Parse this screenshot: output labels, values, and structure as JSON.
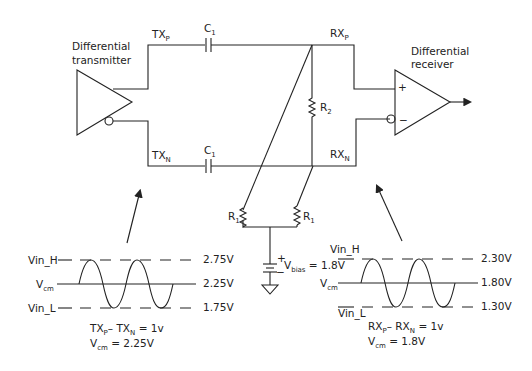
{
  "transmitter": {
    "label_line1": "Differential",
    "label_line2": "transmitter"
  },
  "receiver": {
    "label_line1": "Differential",
    "label_line2": "receiver",
    "plus": "+",
    "minus": "−"
  },
  "nets": {
    "txp": {
      "main": "TX",
      "sub": "P"
    },
    "txn": {
      "main": "TX",
      "sub": "N"
    },
    "rxp": {
      "main": "RX",
      "sub": "P"
    },
    "rxn": {
      "main": "RX",
      "sub": "N"
    }
  },
  "components": {
    "c1_top": {
      "main": "C",
      "sub": "1"
    },
    "c1_bot": {
      "main": "C",
      "sub": "1"
    },
    "r2": {
      "main": "R",
      "sub": "2"
    },
    "r1_left": {
      "main": "R",
      "sub": "1"
    },
    "r1_right": {
      "main": "R",
      "sub": "1"
    },
    "vbias": {
      "main": "V",
      "sub": "bias",
      "value": " = 1.8V",
      "plus": "+",
      "minus": "−"
    }
  },
  "tx_waveform": {
    "vin_h_label": "Vin_H",
    "vcm_label_main": "V",
    "vcm_label_sub": "cm",
    "vin_l_label": "Vin_L",
    "levels": [
      "2.75V",
      "2.25V",
      "1.75V"
    ],
    "eq1": {
      "a": "TX",
      "a_sub": "P",
      "op": "– TX",
      "b_sub": "N",
      "rhs": " = 1v"
    },
    "eq2": {
      "main": "V",
      "sub": "cm",
      "rhs": " = 2.25V"
    }
  },
  "rx_waveform": {
    "vin_h_label": "Vin_H",
    "vcm_label_main": "V",
    "vcm_label_sub": "cm",
    "vin_l_label": "Vin_L",
    "levels": [
      "2.30V",
      "1.80V",
      "1.30V"
    ],
    "eq1": {
      "a": "RX",
      "a_sub": "P",
      "op": "– RX",
      "b_sub": "N",
      "rhs": " = 1v"
    },
    "eq2": {
      "main": "V",
      "sub": "cm",
      "rhs": " = 1.8V"
    }
  }
}
